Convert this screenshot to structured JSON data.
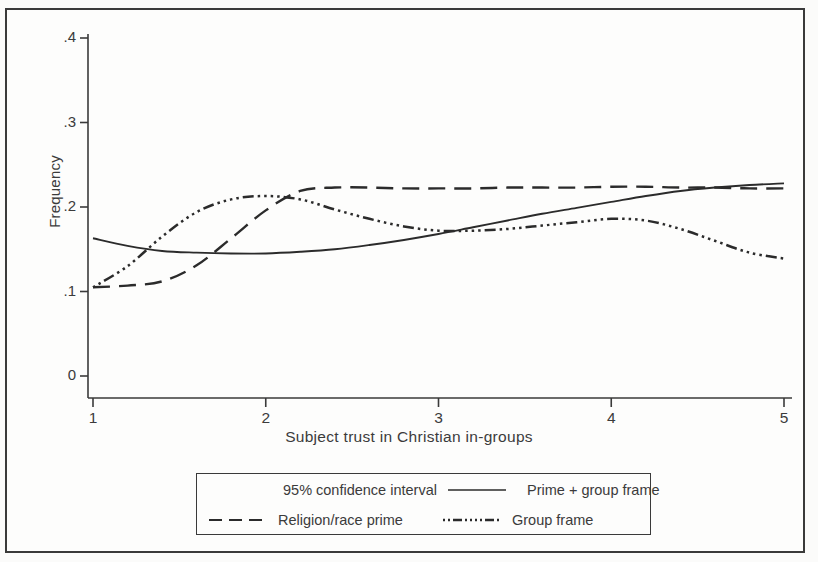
{
  "figure": {
    "background_color": "#fdfdfc",
    "ink_color": "#2b2b2b",
    "border_color": "#3a3a3a"
  },
  "axes": {
    "y_label": "Frequency",
    "x_label": "Subject trust in Christian in-groups",
    "y_ticks": [
      "0",
      ".1",
      ".2",
      ".3",
      ".4"
    ],
    "x_ticks": [
      "1",
      "2",
      "3",
      "4",
      "5"
    ]
  },
  "legend": {
    "row1": [
      {
        "label": "95% confidence interval",
        "style": "solid-thin"
      },
      {
        "label": "Prime + group frame",
        "style": "solid"
      }
    ],
    "row2": [
      {
        "label": "Religion/race prime",
        "style": "dashed"
      },
      {
        "label": "Group frame",
        "style": "dash-dot-dot"
      }
    ]
  },
  "chart_data": {
    "type": "line",
    "title": "",
    "xlabel": "Subject trust in Christian in-groups",
    "ylabel": "Frequency",
    "xlim": [
      1,
      5
    ],
    "ylim": [
      0,
      0.4
    ],
    "yticks": [
      0,
      0.1,
      0.2,
      0.3,
      0.4
    ],
    "xticks": [
      1,
      2,
      3,
      4,
      5
    ],
    "grid": false,
    "legend_position": "below-axes",
    "series": [
      {
        "name": "Prime + group frame",
        "style": "solid",
        "x": [
          1.0,
          1.2,
          1.4,
          1.6,
          1.8,
          2.0,
          2.2,
          2.4,
          2.6,
          2.8,
          3.0,
          3.2,
          3.4,
          3.6,
          3.8,
          4.0,
          4.2,
          4.4,
          4.6,
          4.8,
          5.0
        ],
        "y": [
          0.163,
          0.154,
          0.148,
          0.146,
          0.145,
          0.145,
          0.147,
          0.15,
          0.155,
          0.161,
          0.168,
          0.176,
          0.184,
          0.192,
          0.199,
          0.206,
          0.213,
          0.219,
          0.223,
          0.226,
          0.228
        ]
      },
      {
        "name": "Religion/race prime",
        "style": "dashed",
        "x": [
          1.0,
          1.2,
          1.4,
          1.6,
          1.8,
          2.0,
          2.2,
          2.4,
          2.6,
          2.8,
          3.0,
          3.2,
          3.4,
          3.6,
          3.8,
          4.0,
          4.2,
          4.4,
          4.6,
          4.8,
          5.0
        ],
        "y": [
          0.105,
          0.107,
          0.112,
          0.131,
          0.163,
          0.196,
          0.219,
          0.223,
          0.223,
          0.222,
          0.222,
          0.222,
          0.223,
          0.223,
          0.223,
          0.224,
          0.224,
          0.223,
          0.223,
          0.222,
          0.222
        ]
      },
      {
        "name": "Group frame",
        "style": "dash-dot-dot",
        "x": [
          1.0,
          1.2,
          1.4,
          1.6,
          1.8,
          2.0,
          2.2,
          2.4,
          2.6,
          2.8,
          3.0,
          3.2,
          3.4,
          3.6,
          3.8,
          4.0,
          4.2,
          4.4,
          4.6,
          4.8,
          5.0
        ],
        "y": [
          0.105,
          0.13,
          0.165,
          0.194,
          0.209,
          0.213,
          0.209,
          0.197,
          0.186,
          0.177,
          0.172,
          0.172,
          0.174,
          0.178,
          0.182,
          0.186,
          0.184,
          0.174,
          0.16,
          0.146,
          0.139
        ]
      }
    ]
  }
}
